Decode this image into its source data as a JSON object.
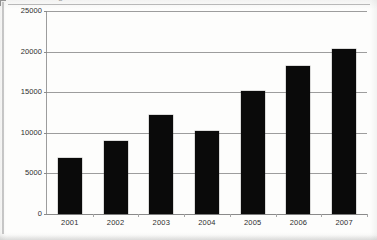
{
  "document": {
    "kind": "scanned-bar-chart",
    "cut_title_fragment": "g"
  },
  "chart_data": {
    "type": "bar",
    "title": "",
    "xlabel": "",
    "ylabel": "",
    "categories": [
      "2001",
      "2002",
      "2003",
      "2004",
      "2005",
      "2006",
      "2007"
    ],
    "values": [
      6900,
      9000,
      12200,
      10200,
      15200,
      18200,
      20300
    ],
    "ylim": [
      0,
      25000
    ],
    "ytick_values": [
      0,
      5000,
      10000,
      15000,
      20000,
      25000
    ],
    "ytick_labels": [
      "0",
      "5000",
      "10000",
      "15000",
      "20000",
      "25000"
    ],
    "grid": true,
    "legend": false,
    "bar_color": "#0a0a0a",
    "gridline_color": "#9d9d9d",
    "axis_color": "#8a8a8a",
    "background_color": "#fdfdfc"
  }
}
